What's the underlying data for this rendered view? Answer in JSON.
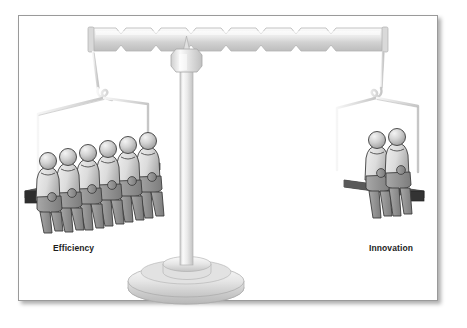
{
  "illustration": {
    "title": "Balance scale weighing Efficiency against Innovation",
    "type": "conceptual-diagram",
    "style": "grayscale line art with gradient shading",
    "frame": {
      "border_color": "#9a9a9a",
      "background_color": "#ffffff",
      "shadow": "drop shadow bottom-right"
    },
    "labels": {
      "left": "Efficiency",
      "right": "Innovation",
      "color": "#1d1d1d"
    },
    "scale": {
      "beam_label": "balance-beam",
      "beam_pattern": "chevron-notched",
      "beam_color_light": "#f2f2f2",
      "beam_color_dark": "#c9c9c9",
      "column_label": "center-column",
      "base_label": "pedestal-base",
      "pivot_label": "fulcrum-pivot",
      "tilt": "level"
    },
    "pans": [
      {
        "side": "left",
        "label": "Efficiency",
        "figure_count": 6,
        "bench_color": "#3a3a3a",
        "hanger": "wire-frame-left"
      },
      {
        "side": "right",
        "label": "Innovation",
        "figure_count": 2,
        "bench_color": "#3a3a3a",
        "hanger": "wire-frame-right"
      }
    ],
    "figure_colors": {
      "head_light": "#e8e8e8",
      "head_mid": "#b4b4b4",
      "torso_light": "#e4e4e4",
      "torso_mid": "#bdbdbd",
      "legs": "#8e8e8e",
      "outline": "#3c3c3c"
    }
  }
}
